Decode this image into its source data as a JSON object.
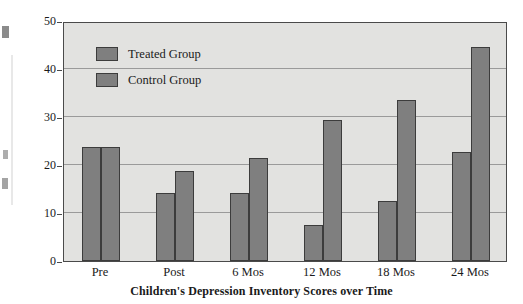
{
  "chart_data": {
    "type": "bar",
    "title": "",
    "xlabel": "Children's Depression Inventory Scores over Time",
    "ylabel": "Percentage with CDI Scores of 15 or Above",
    "categories": [
      "Pre",
      "Post",
      "6 Mos",
      "12 Mos",
      "18 Mos",
      "24 Mos"
    ],
    "series": [
      {
        "name": "Treated Group",
        "values": [
          23.7,
          14.2,
          14.1,
          7.5,
          12.4,
          22.8
        ]
      },
      {
        "name": "Control Group",
        "values": [
          23.7,
          18.8,
          21.4,
          29.4,
          33.6,
          44.5
        ]
      }
    ],
    "ylim": [
      0,
      50
    ],
    "yticks": [
      0,
      10,
      20,
      30,
      40,
      50
    ],
    "ytick_labels": [
      "0",
      "10",
      "20",
      "30",
      "40",
      "50"
    ],
    "grid": true,
    "legend_position": "upper left inside plot",
    "colors": {
      "bar_fill": "#7f7f7f",
      "bar_stroke": "#3c3c3c",
      "plot_background": "#e2e2e0",
      "gridline": "#9a9a9a",
      "axis": "#4a4a4a",
      "page_background": "#ffffff",
      "text": "#1a1a1a"
    }
  }
}
